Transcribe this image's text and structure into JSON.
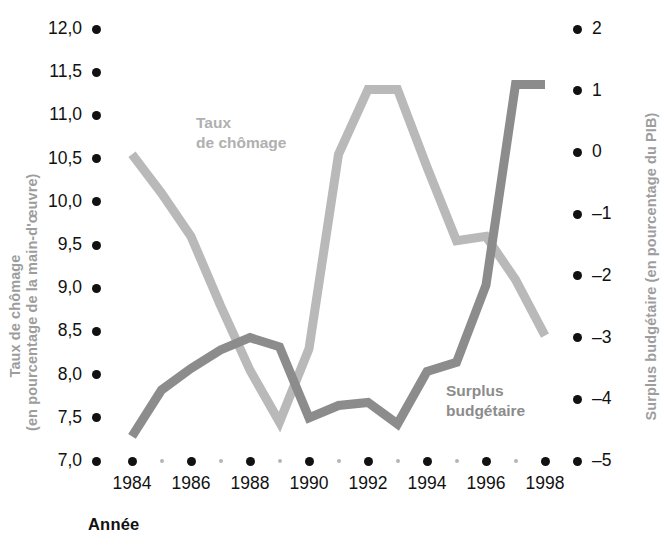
{
  "axes": {
    "left_title": "Taux de chômage\n(en pourcentage de la main-d'œuvre)",
    "right_title": "Surplus budgétaire (en pourcentage du PIB)",
    "x_title": "Année"
  },
  "series_labels": {
    "chomage": "Taux\nde chômage",
    "surplus": "Surplus\nbudgétaire"
  },
  "colors": {
    "chomage": "#b9b9b9",
    "surplus": "#8c8c8c",
    "tick": "#111111",
    "minor_tick": "#b5b5b5",
    "axis_title": "#9d9d9d",
    "background": "#ffffff"
  },
  "left_ticks": [
    "12,0",
    "11,5",
    "11,0",
    "10,5",
    "10,0",
    "9,5",
    "9,0",
    "8,5",
    "8,0",
    "7,5",
    "7,0"
  ],
  "right_ticks": [
    "2",
    "1",
    "0",
    "–1",
    "–2",
    "–3",
    "–4",
    "–5"
  ],
  "x_ticks": [
    "1984",
    "1986",
    "1988",
    "1990",
    "1992",
    "1994",
    "1996",
    "1998"
  ],
  "x_minor_ticks": [
    "1985",
    "1987",
    "1989",
    "1991",
    "1993",
    "1995",
    "1997"
  ],
  "chart_data": {
    "type": "line",
    "title": "",
    "xlabel": "Année",
    "ylabel": "Taux de chômage (en pourcentage de la main-d'œuvre)",
    "y2label": "Surplus budgétaire (en pourcentage du PIB)",
    "grid": false,
    "legend": "inline-annotations",
    "x": [
      1984,
      1985,
      1986,
      1987,
      1988,
      1989,
      1990,
      1991,
      1992,
      1993,
      1994,
      1995,
      1996,
      1997,
      1998
    ],
    "xlim": [
      1984,
      1998
    ],
    "ylim": [
      7.0,
      12.0
    ],
    "y2lim": [
      -5,
      2
    ],
    "series": [
      {
        "name": "Taux de chômage",
        "axis": "left",
        "color": "#b9b9b9",
        "values": [
          10.55,
          10.1,
          9.6,
          8.8,
          8.05,
          7.45,
          8.3,
          10.55,
          11.3,
          11.3,
          10.4,
          9.55,
          9.6,
          9.1,
          8.45
        ]
      },
      {
        "name": "Surplus budgétaire",
        "axis": "right",
        "color": "#8c8c8c",
        "values": [
          -4.6,
          -3.85,
          -3.5,
          -3.2,
          -3.0,
          -3.15,
          -4.3,
          -4.1,
          -4.05,
          -4.4,
          -3.55,
          -3.4,
          -2.15,
          1.1,
          1.1
        ]
      }
    ]
  }
}
